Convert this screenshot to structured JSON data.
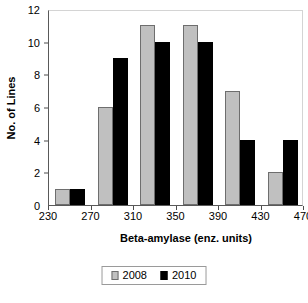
{
  "chart_data": {
    "type": "bar",
    "title": "",
    "subtitle": "",
    "xlabel": "Beta-amylase (enz. units)",
    "ylabel": "No. of Lines",
    "categories": [
      "250",
      "290",
      "330",
      "370",
      "410",
      "450"
    ],
    "x_tick_labels": [
      "230",
      "270",
      "310",
      "350",
      "390",
      "430",
      "470"
    ],
    "y_tick_labels": [
      "0",
      "2",
      "4",
      "6",
      "8",
      "10",
      "12"
    ],
    "xlim": [
      230,
      470
    ],
    "ylim": [
      0,
      12
    ],
    "grid": false,
    "legend_position": "bottom",
    "series": [
      {
        "name": "2008",
        "color": "#C0C0C0",
        "values": [
          1,
          6,
          11,
          11,
          7,
          2
        ]
      },
      {
        "name": "2010",
        "color": "#000000",
        "values": [
          1,
          9,
          10,
          10,
          4,
          4
        ]
      }
    ]
  },
  "legend": {
    "items": [
      {
        "label": "2008"
      },
      {
        "label": "2010"
      }
    ]
  }
}
